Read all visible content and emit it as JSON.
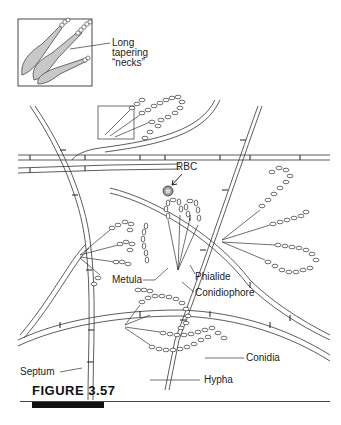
{
  "figure": {
    "caption": "FIGURE 3.57",
    "inset": {
      "label_line1": "Long",
      "label_line2": "tapering",
      "label_line3": "“necks”"
    },
    "labels": {
      "rbc": "RBC",
      "metula": "Metula",
      "phialide": "Phialide",
      "conidiophore": "Conidiophore",
      "conidia": "Conidia",
      "septum": "Septum",
      "hypha": "Hypha"
    },
    "colors": {
      "line": "#333333",
      "neck_fill": "#c8c8c8",
      "rbc_fill": "#9a9a9a",
      "caption_bar": "#111111"
    }
  }
}
